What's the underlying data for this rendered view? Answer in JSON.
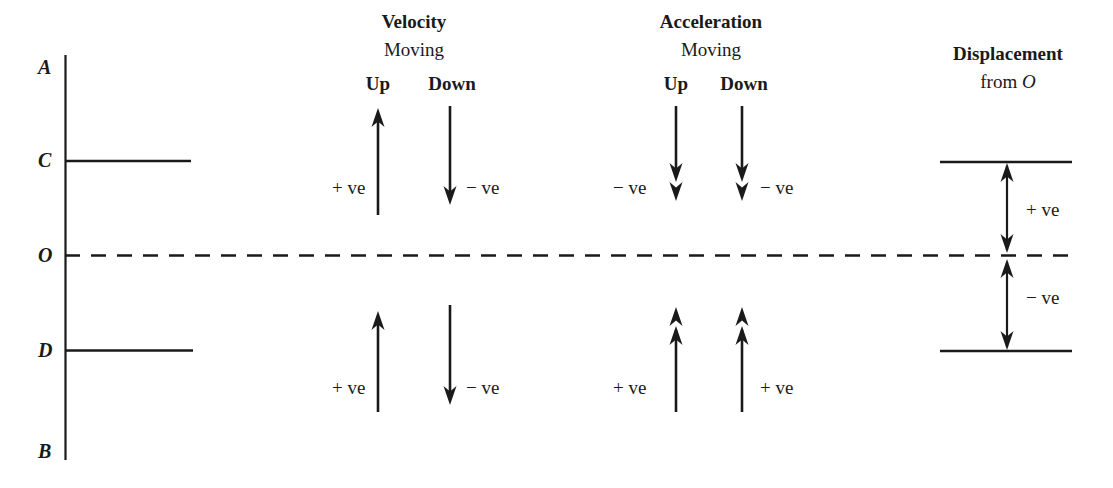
{
  "figure": {
    "type": "physics-sign-convention-diagram"
  },
  "axis": {
    "name": "vertical-reference-line",
    "top_label": "A",
    "bottom_label": "B",
    "origin_label": "O",
    "upper_level_label": "C",
    "lower_level_label": "D",
    "x": 65,
    "y_top": 55,
    "y_bottom": 460,
    "y_C": 161,
    "y_O": 255,
    "y_D": 350
  },
  "columns": [
    {
      "key": "velocity",
      "title": "Velocity",
      "subtitle": "Moving",
      "directions": [
        {
          "key": "up",
          "label": "Up",
          "x": 378,
          "upper": {
            "arrow": "single-up",
            "sign": "+ ve",
            "sign_side": "left"
          },
          "lower": {
            "arrow": "single-up",
            "sign": "+ ve",
            "sign_side": "left"
          }
        },
        {
          "key": "down",
          "label": "Down",
          "x": 450,
          "upper": {
            "arrow": "single-down",
            "sign": "− ve",
            "sign_side": "right"
          },
          "lower": {
            "arrow": "single-down",
            "sign": "− ve",
            "sign_side": "right"
          }
        }
      ]
    },
    {
      "key": "acceleration",
      "title": "Acceleration",
      "subtitle": "Moving",
      "directions": [
        {
          "key": "up",
          "label": "Up",
          "x": 676,
          "upper": {
            "arrow": "double-down",
            "sign": "− ve",
            "sign_side": "left"
          },
          "lower": {
            "arrow": "double-up",
            "sign": "+ ve",
            "sign_side": "left"
          }
        },
        {
          "key": "down",
          "label": "Down",
          "x": 742,
          "upper": {
            "arrow": "double-down",
            "sign": "− ve",
            "sign_side": "right"
          },
          "lower": {
            "arrow": "double-up",
            "sign": "+ ve",
            "sign_side": "right"
          }
        }
      ]
    },
    {
      "key": "displacement",
      "title": "Displacement",
      "subtitle_pre": "from ",
      "subtitle_italic": "O",
      "x": 1007,
      "line_x1": 940,
      "line_x2": 1072,
      "measures": [
        {
          "key": "above-origin",
          "arrow": "double-headed",
          "from": "C",
          "to": "O",
          "sign": "+ ve"
        },
        {
          "key": "below-origin",
          "arrow": "double-headed",
          "from": "O",
          "to": "D",
          "sign": "− ve"
        }
      ]
    }
  ],
  "style": {
    "ink": "#1a1a1a",
    "background": "#ffffff",
    "line_width": 2
  }
}
